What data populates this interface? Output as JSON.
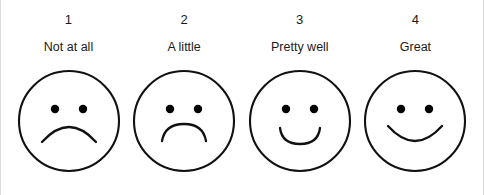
{
  "widget": {
    "name": "smiley-face-rating-scale",
    "background_color": "#ffffff",
    "stroke_color": "#111111",
    "text_color": "#1a1a1a",
    "edge_rule_color": "#dcdcdc"
  },
  "options": [
    {
      "number": "1",
      "label": "Not at all",
      "face": "sad-face",
      "mouth_path": "M 26 74 Q 53 44 80 74",
      "expression": "deep frown"
    },
    {
      "number": "2",
      "label": "A little",
      "face": "slightly-sad-face",
      "mouth_path": "M 31 73 Q 34 56 53 56 Q 72 56 75 73",
      "expression": "shallow frown"
    },
    {
      "number": "3",
      "label": "Pretty well",
      "face": "slightly-happy-face",
      "mouth_path": "M 33 60 Q 35 76 53 76 Q 71 76 73 60",
      "expression": "small smile"
    },
    {
      "number": "4",
      "label": "Great",
      "face": "happy-face",
      "mouth_path": "M 26 58 Q 53 88 80 58",
      "expression": "wide smile"
    }
  ],
  "face_geometry": {
    "circle_center_x": 53,
    "circle_center_y": 53,
    "circle_radius": 50,
    "eye_left_x": 39,
    "eye_right_x": 67,
    "eye_y": 41,
    "eye_radius": 4.2
  }
}
